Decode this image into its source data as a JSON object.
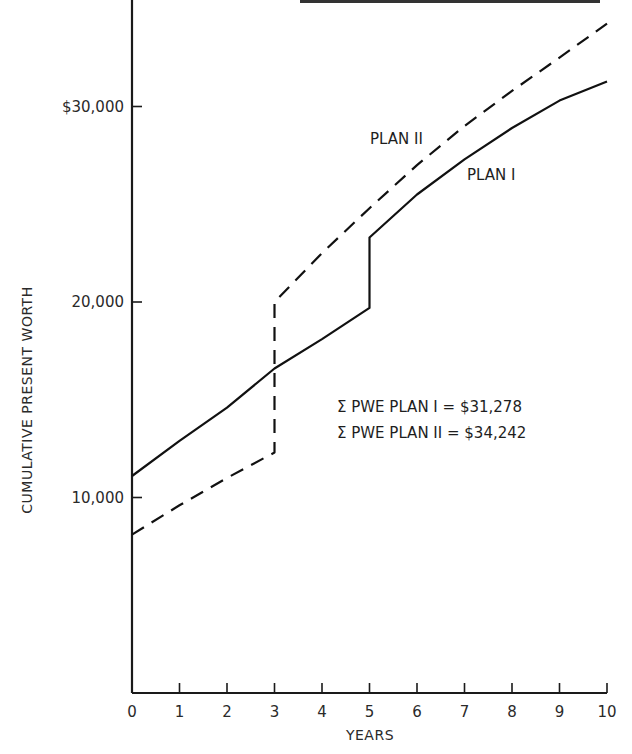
{
  "chart_data": {
    "type": "line",
    "title": "",
    "xlabel": "YEARS",
    "ylabel": "CUMULATIVE PRESENT WORTH",
    "xlim": [
      0,
      10
    ],
    "ylim": [
      0,
      35500
    ],
    "grid": false,
    "x_ticks": [
      "0",
      "1",
      "2",
      "3",
      "4",
      "5",
      "6",
      "7",
      "8",
      "9",
      "10"
    ],
    "y_ticks": [
      {
        "value": 10000,
        "label": "10,000"
      },
      {
        "value": 20000,
        "label": "20,000"
      },
      {
        "value": 30000,
        "label": "$30,000"
      }
    ],
    "series": [
      {
        "name": "PLAN I",
        "style": "solid",
        "points": [
          [
            0,
            11100
          ],
          [
            1,
            12900
          ],
          [
            2,
            14600
          ],
          [
            3,
            16600
          ],
          [
            4,
            18100
          ],
          [
            5,
            19700
          ],
          [
            5,
            23300
          ],
          [
            6,
            25500
          ],
          [
            7,
            27300
          ],
          [
            8,
            28900
          ],
          [
            9,
            30300
          ],
          [
            10,
            31278
          ]
        ]
      },
      {
        "name": "PLAN II",
        "style": "dashed",
        "points": [
          [
            0,
            8100
          ],
          [
            1,
            9600
          ],
          [
            2,
            11000
          ],
          [
            3,
            12300
          ],
          [
            3,
            20000
          ],
          [
            4,
            22500
          ],
          [
            5,
            24800
          ],
          [
            6,
            27000
          ],
          [
            7,
            29000
          ],
          [
            8,
            30800
          ],
          [
            9,
            32500
          ],
          [
            10,
            34242
          ]
        ]
      }
    ],
    "annotations": [
      "Σ PWE PLAN I = $31,278",
      "Σ PWE PLAN II = $34,242"
    ],
    "series_labels": [
      {
        "text": "PLAN II",
        "x": 5.2,
        "y": 29400
      },
      {
        "text": "PLAN I",
        "x": 7.0,
        "y": 26100
      }
    ]
  }
}
